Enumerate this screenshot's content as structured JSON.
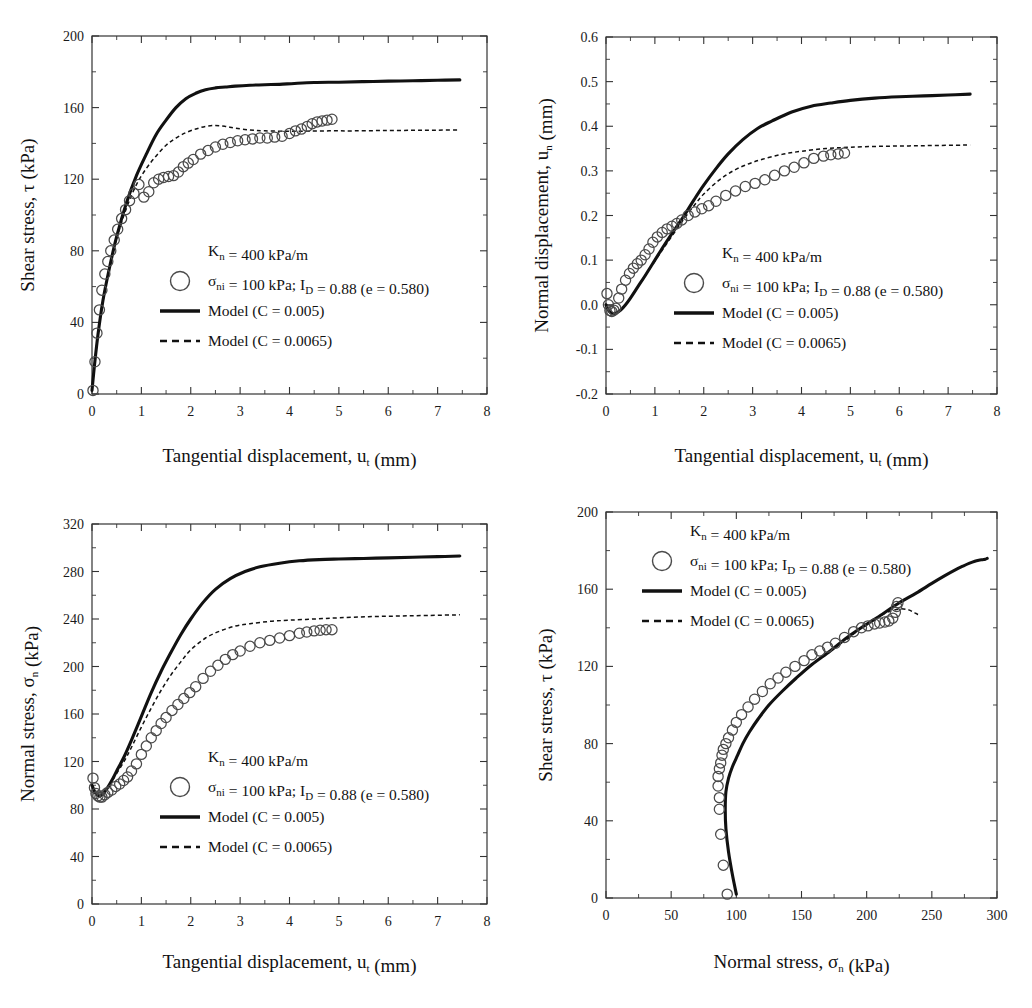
{
  "figure": {
    "panel_count": 4
  },
  "legend_common": {
    "kn_label": "K",
    "kn_sub": "n",
    "kn_value": " = 400 kPa/m",
    "sigma_label": "σ",
    "sigma_sub": "ni",
    "sigma_value": " = 100 kPa; I",
    "id_sub": "D",
    "id_value": " = 0.88 (e = 0.580)",
    "model_solid": "Model (C = 0.005)",
    "model_dash": "Model (C = 0.0065)",
    "marker_icon": "open-circle-icon",
    "solid_icon": "solid-line-icon",
    "dash_icon": "dashed-line-icon"
  },
  "axis_titles": {
    "tangential": "Tangential displacement, u",
    "tangential_sub": "t",
    "tangential_unit": " (mm)",
    "shear": "Shear stress, τ (kPa)",
    "normal_disp": "Normal displacement, u",
    "normal_disp_sub": "n",
    "normal_disp_unit": " (mm)",
    "normal_stress": "Normal stress, σ",
    "normal_stress_sub": "n",
    "normal_stress_unit": " (kPa)"
  },
  "chart_data": [
    {
      "id": "panel-a",
      "type": "line",
      "position": "top-left",
      "title": "",
      "xlabel": "Tangential displacement, u_t (mm)",
      "ylabel": "Shear stress, τ (kPa)",
      "xlim": [
        0,
        8
      ],
      "ylim": [
        0,
        200
      ],
      "xticks": [
        0,
        1,
        2,
        3,
        4,
        5,
        6,
        7,
        8
      ],
      "yticks": [
        0,
        40,
        80,
        120,
        160,
        200
      ],
      "xminor_step": 0.5,
      "yminor_step": 20,
      "grid": false,
      "legend_position": "center",
      "series": [
        {
          "name": "Model (C = 0.005)",
          "style": "solid",
          "x": [
            0,
            0.05,
            0.12,
            0.22,
            0.35,
            0.5,
            0.7,
            0.9,
            1.1,
            1.3,
            1.5,
            1.7,
            1.9,
            2.1,
            2.3,
            2.5,
            2.7,
            2.9,
            3.2,
            3.5,
            3.8,
            4.1,
            4.5,
            5.0,
            5.5,
            6.0,
            6.5,
            7.0,
            7.45
          ],
          "y": [
            2,
            16,
            33,
            52,
            70,
            88,
            107,
            122,
            134,
            145,
            153,
            160,
            165,
            168,
            170,
            171,
            171.5,
            172,
            172.5,
            172.8,
            173,
            173.5,
            174,
            174.2,
            174.5,
            174.8,
            175,
            175.3,
            175.5
          ]
        },
        {
          "name": "Model (C = 0.0065)",
          "style": "dashed",
          "x": [
            0,
            0.05,
            0.12,
            0.22,
            0.35,
            0.5,
            0.7,
            0.9,
            1.1,
            1.3,
            1.5,
            1.7,
            1.9,
            2.1,
            2.3,
            2.5,
            2.7,
            2.9,
            3.2,
            3.5,
            3.9,
            4.3,
            4.8,
            5.3,
            5.9,
            6.5,
            7.0,
            7.45
          ],
          "y": [
            2,
            16,
            33,
            52,
            70,
            87,
            104,
            117,
            126,
            133,
            139,
            143,
            146,
            148,
            149.5,
            150,
            149.5,
            148.5,
            147.5,
            147,
            146.8,
            146.8,
            147,
            147,
            147.2,
            147.3,
            147.4,
            147.5
          ]
        },
        {
          "name": "σ_ni = 100 kPa; I_D = 0.88 (e = 0.580)",
          "style": "markers",
          "x": [
            0.02,
            0.06,
            0.1,
            0.15,
            0.2,
            0.26,
            0.32,
            0.38,
            0.45,
            0.52,
            0.6,
            0.68,
            0.76,
            0.85,
            0.95,
            1.05,
            1.15,
            1.25,
            1.35,
            1.45,
            1.55,
            1.65,
            1.75,
            1.85,
            1.95,
            2.05,
            2.2,
            2.35,
            2.5,
            2.65,
            2.8,
            2.95,
            3.1,
            3.25,
            3.4,
            3.55,
            3.7,
            3.85,
            4.0,
            4.12,
            4.24,
            4.36,
            4.46,
            4.56,
            4.66,
            4.76,
            4.86
          ],
          "y": [
            2,
            18,
            34,
            47,
            58,
            67,
            74,
            80,
            86,
            92,
            98,
            103,
            108,
            112,
            117,
            110,
            113,
            118,
            120,
            121,
            121.5,
            122,
            124,
            127,
            129,
            131,
            134,
            136,
            138,
            139.5,
            140.5,
            141.5,
            142,
            142.5,
            143,
            143,
            143.5,
            144,
            145.5,
            147,
            148,
            149.5,
            151,
            152,
            152.5,
            153,
            153.5
          ]
        }
      ]
    },
    {
      "id": "panel-b",
      "type": "line",
      "position": "top-right",
      "title": "",
      "xlabel": "Tangential displacement, u_t (mm)",
      "ylabel": "Normal displacement, u_n (mm)",
      "xlim": [
        0,
        8
      ],
      "ylim": [
        -0.2,
        0.6
      ],
      "xticks": [
        0,
        1,
        2,
        3,
        4,
        5,
        6,
        7,
        8
      ],
      "yticks": [
        -0.2,
        -0.1,
        0.0,
        0.1,
        0.2,
        0.3,
        0.4,
        0.5,
        0.6
      ],
      "ytick_labels": [
        "-0.2",
        "-0.1",
        "0.0",
        "0.1",
        "0.2",
        "0.3",
        "0.4",
        "0.5",
        "0.6"
      ],
      "xminor_step": 0.5,
      "yminor_step": 0.05,
      "grid": false,
      "legend_position": "center",
      "series": [
        {
          "name": "Model (C = 0.005)",
          "style": "solid",
          "x": [
            0,
            0.05,
            0.1,
            0.15,
            0.2,
            0.3,
            0.4,
            0.5,
            0.65,
            0.8,
            1.0,
            1.2,
            1.4,
            1.6,
            1.8,
            2.0,
            2.25,
            2.5,
            2.8,
            3.1,
            3.4,
            3.8,
            4.2,
            4.6,
            5.0,
            5.5,
            6.0,
            6.5,
            7.0,
            7.45
          ],
          "y": [
            0.0,
            -0.012,
            -0.018,
            -0.02,
            -0.019,
            -0.012,
            0.0,
            0.015,
            0.04,
            0.065,
            0.1,
            0.135,
            0.168,
            0.2,
            0.235,
            0.268,
            0.305,
            0.338,
            0.37,
            0.395,
            0.412,
            0.432,
            0.445,
            0.452,
            0.458,
            0.463,
            0.466,
            0.468,
            0.47,
            0.472
          ]
        },
        {
          "name": "Model (C = 0.0065)",
          "style": "dashed",
          "x": [
            0,
            0.05,
            0.1,
            0.15,
            0.2,
            0.3,
            0.4,
            0.5,
            0.65,
            0.8,
            1.0,
            1.2,
            1.4,
            1.6,
            1.8,
            2.0,
            2.3,
            2.6,
            2.9,
            3.2,
            3.6,
            4.0,
            4.5,
            5.0,
            5.6,
            6.2,
            6.8,
            7.45
          ],
          "y": [
            0.0,
            -0.012,
            -0.018,
            -0.02,
            -0.019,
            -0.012,
            0.0,
            0.015,
            0.04,
            0.065,
            0.098,
            0.13,
            0.162,
            0.193,
            0.222,
            0.248,
            0.278,
            0.3,
            0.315,
            0.326,
            0.337,
            0.344,
            0.35,
            0.353,
            0.355,
            0.356,
            0.357,
            0.358
          ]
        },
        {
          "name": "σ_ni = 100 kPa; I_D = 0.88 (e = 0.580)",
          "style": "markers",
          "x": [
            0.02,
            0.05,
            0.08,
            0.12,
            0.16,
            0.2,
            0.26,
            0.32,
            0.4,
            0.48,
            0.56,
            0.64,
            0.72,
            0.8,
            0.88,
            0.96,
            1.05,
            1.15,
            1.25,
            1.35,
            1.45,
            1.55,
            1.68,
            1.82,
            1.96,
            2.1,
            2.25,
            2.45,
            2.65,
            2.85,
            3.05,
            3.25,
            3.45,
            3.65,
            3.85,
            4.05,
            4.25,
            4.45,
            4.6,
            4.75,
            4.88
          ],
          "y": [
            0.025,
            0.0,
            -0.013,
            -0.015,
            -0.012,
            -0.008,
            0.015,
            0.035,
            0.055,
            0.07,
            0.082,
            0.092,
            0.1,
            0.112,
            0.125,
            0.14,
            0.152,
            0.162,
            0.17,
            0.176,
            0.182,
            0.19,
            0.2,
            0.208,
            0.215,
            0.222,
            0.232,
            0.245,
            0.255,
            0.265,
            0.272,
            0.28,
            0.29,
            0.3,
            0.308,
            0.318,
            0.328,
            0.333,
            0.336,
            0.338,
            0.34
          ]
        }
      ]
    },
    {
      "id": "panel-c",
      "type": "line",
      "position": "bottom-left",
      "title": "",
      "xlabel": "Tangential displacement, u_t (mm)",
      "ylabel": "Normal stress, σ_n (kPa)",
      "xlim": [
        0,
        8
      ],
      "ylim": [
        0,
        320
      ],
      "xticks": [
        0,
        1,
        2,
        3,
        4,
        5,
        6,
        7,
        8
      ],
      "yticks": [
        0,
        40,
        80,
        120,
        160,
        200,
        240,
        280,
        320
      ],
      "xminor_step": 0.5,
      "yminor_step": 20,
      "grid": false,
      "legend_position": "center",
      "series": [
        {
          "name": "Model (C = 0.005)",
          "style": "solid",
          "x": [
            0,
            0.05,
            0.1,
            0.15,
            0.2,
            0.3,
            0.4,
            0.5,
            0.65,
            0.8,
            1.0,
            1.2,
            1.4,
            1.6,
            1.8,
            2.0,
            2.25,
            2.5,
            2.8,
            3.1,
            3.4,
            3.8,
            4.2,
            4.6,
            5.0,
            5.5,
            6.0,
            6.5,
            7.0,
            7.45
          ],
          "y": [
            100,
            95,
            92,
            91,
            92,
            97,
            104,
            112,
            124,
            138,
            158,
            178,
            196,
            212,
            227,
            240,
            254,
            265,
            274,
            280,
            284,
            287,
            289,
            290,
            290.5,
            291,
            291.5,
            292,
            292.5,
            293
          ]
        },
        {
          "name": "Model (C = 0.0065)",
          "style": "dashed",
          "x": [
            0,
            0.05,
            0.1,
            0.15,
            0.2,
            0.3,
            0.4,
            0.5,
            0.65,
            0.8,
            1.0,
            1.2,
            1.4,
            1.6,
            1.8,
            2.0,
            2.3,
            2.6,
            2.9,
            3.2,
            3.6,
            4.0,
            4.5,
            5.0,
            5.6,
            6.2,
            6.8,
            7.45
          ],
          "y": [
            100,
            95,
            92,
            91,
            92,
            97,
            103,
            110,
            120,
            132,
            149,
            165,
            180,
            193,
            204,
            214,
            224,
            230,
            234,
            236,
            238,
            239,
            240,
            241,
            242,
            242.5,
            243,
            243.5
          ]
        },
        {
          "name": "σ_ni = 100 kPa; I_D = 0.88 (e = 0.580)",
          "style": "markers",
          "x": [
            0.02,
            0.05,
            0.08,
            0.12,
            0.16,
            0.2,
            0.26,
            0.32,
            0.4,
            0.48,
            0.56,
            0.64,
            0.72,
            0.8,
            0.9,
            1.0,
            1.1,
            1.2,
            1.3,
            1.4,
            1.5,
            1.62,
            1.74,
            1.86,
            1.98,
            2.1,
            2.25,
            2.4,
            2.55,
            2.7,
            2.85,
            3.0,
            3.2,
            3.4,
            3.6,
            3.8,
            4.0,
            4.2,
            4.35,
            4.5,
            4.62,
            4.74,
            4.86
          ],
          "y": [
            106,
            98,
            93,
            91,
            90,
            90,
            92,
            94,
            96,
            99,
            101,
            104,
            107,
            112,
            118,
            126,
            133,
            140,
            146,
            152,
            157,
            163,
            168,
            173,
            178,
            183,
            190,
            196,
            201,
            206,
            210,
            213,
            217,
            220,
            222,
            224,
            226,
            228,
            229,
            230,
            230.5,
            231,
            231
          ]
        }
      ]
    },
    {
      "id": "panel-d",
      "type": "line",
      "position": "bottom-right",
      "title": "",
      "xlabel": "Normal stress, σ_n (kPa)",
      "ylabel": "Shear stress, τ (kPa)",
      "xlim": [
        0,
        300
      ],
      "ylim": [
        0,
        200
      ],
      "xticks": [
        0,
        50,
        100,
        150,
        200,
        250,
        300
      ],
      "yticks": [
        0,
        40,
        80,
        120,
        160,
        200
      ],
      "xminor_step": 25,
      "yminor_step": 20,
      "grid": false,
      "legend_position": "top-left",
      "series": [
        {
          "name": "Model (C = 0.005)",
          "style": "solid",
          "x": [
            100,
            97,
            94,
            92,
            91.5,
            92,
            94,
            97,
            101,
            105,
            110,
            117,
            125,
            135,
            146,
            158,
            172,
            185,
            198,
            212,
            225,
            238,
            250,
            260,
            268,
            274,
            279,
            283,
            286,
            289,
            291,
            292.5
          ],
          "y": [
            2,
            12,
            24,
            36,
            46,
            55,
            62,
            68,
            74,
            80,
            86,
            93,
            100,
            107,
            114,
            121,
            128,
            135,
            141,
            147,
            153,
            158,
            163,
            167,
            170,
            172,
            173.5,
            174.5,
            175,
            175.3,
            175.5,
            176
          ]
        },
        {
          "name": "Model (C = 0.0065)",
          "style": "dashed",
          "x": [
            185,
            196,
            206,
            214,
            220,
            226,
            231,
            234,
            236,
            238,
            239,
            240,
            241
          ],
          "y": [
            134,
            140,
            144.5,
            147.5,
            149,
            149.8,
            149.5,
            148.8,
            148,
            147.4,
            147,
            146.8,
            146.8
          ]
        },
        {
          "name": "σ_ni = 100 kPa; I_D = 0.88 (e = 0.580)",
          "style": "markers",
          "x": [
            93,
            90,
            88,
            87,
            87,
            86,
            86,
            87,
            88,
            89,
            90,
            92,
            94,
            97,
            100,
            104,
            109,
            114,
            120,
            126,
            132,
            138,
            145,
            152,
            158,
            164,
            170,
            176,
            183,
            190,
            196,
            201,
            206,
            210,
            214,
            217,
            220,
            222,
            223,
            224
          ],
          "y": [
            2,
            17,
            33,
            46,
            52,
            58,
            63,
            67,
            70,
            74,
            77,
            80,
            83,
            87,
            91,
            95,
            99,
            103,
            107,
            111,
            114,
            117,
            120,
            123,
            126,
            128,
            130,
            132,
            135,
            138,
            140,
            141,
            142,
            142.5,
            143,
            143.5,
            145,
            148,
            151,
            153
          ]
        }
      ]
    }
  ]
}
